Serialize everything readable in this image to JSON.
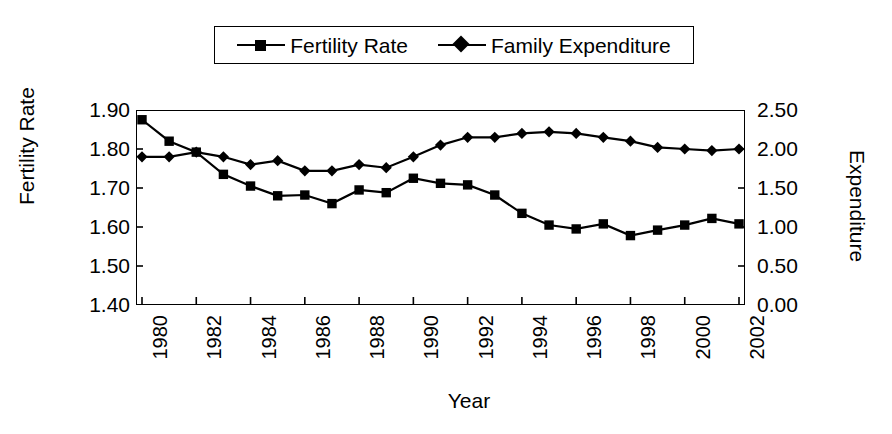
{
  "chart_data": {
    "type": "line",
    "title": "",
    "xlabel": "Year",
    "ylabel": "Fertility Rate",
    "y2label": "Expenditure",
    "grid": false,
    "legend_position": "top-center",
    "x": [
      1980,
      1981,
      1982,
      1983,
      1984,
      1985,
      1986,
      1987,
      1988,
      1989,
      1990,
      1991,
      1992,
      1993,
      1994,
      1995,
      1996,
      1997,
      1998,
      1999,
      2000,
      2001,
      2002
    ],
    "xtick_labels": [
      "1980",
      "1982",
      "1984",
      "1986",
      "1988",
      "1990",
      "1992",
      "1994",
      "1996",
      "1998",
      "2000",
      "2002"
    ],
    "xtick_values": [
      1980,
      1982,
      1984,
      1986,
      1988,
      1990,
      1992,
      1994,
      1996,
      1998,
      2000,
      2002
    ],
    "xlim": [
      1980,
      2002
    ],
    "ylim": [
      1.4,
      1.9
    ],
    "ytick_labels": [
      "1.90",
      "1.80",
      "1.70",
      "1.60",
      "1.50",
      "1.40"
    ],
    "ytick_values": [
      1.9,
      1.8,
      1.7,
      1.6,
      1.5,
      1.4
    ],
    "y2lim": [
      0.0,
      2.5
    ],
    "y2tick_labels": [
      "2.50",
      "2.00",
      "1.50",
      "1.00",
      "0.50",
      "0.00"
    ],
    "y2tick_values": [
      2.5,
      2.0,
      1.5,
      1.0,
      0.5,
      0.0
    ],
    "series": [
      {
        "name": "Fertility Rate",
        "axis": "left",
        "marker": "square",
        "color": "#000000",
        "values": [
          1.875,
          1.82,
          1.792,
          1.735,
          1.705,
          1.68,
          1.682,
          1.66,
          1.695,
          1.688,
          1.725,
          1.712,
          1.708,
          1.682,
          1.635,
          1.605,
          1.595,
          1.608,
          1.578,
          1.592,
          1.605,
          1.622,
          1.608
        ]
      },
      {
        "name": "Family Expenditure",
        "axis": "right",
        "marker": "diamond",
        "color": "#000000",
        "values": [
          1.9,
          1.9,
          1.96,
          1.9,
          1.8,
          1.85,
          1.72,
          1.72,
          1.8,
          1.76,
          1.9,
          2.05,
          2.15,
          2.15,
          2.2,
          2.22,
          2.2,
          2.15,
          2.1,
          2.02,
          2.0,
          1.98,
          2.0
        ]
      }
    ]
  },
  "legend": {
    "entries": [
      {
        "label": "Fertility Rate",
        "marker": "square"
      },
      {
        "label": "Family Expenditure",
        "marker": "diamond"
      }
    ]
  },
  "axes": {
    "left_title": "Fertility Rate",
    "right_title": "Expenditure",
    "bottom_title": "Year"
  }
}
